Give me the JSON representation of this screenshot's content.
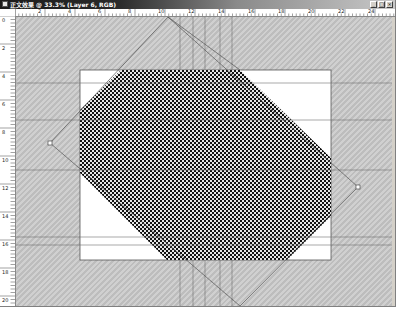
{
  "window": {
    "title": "正文效果 @ 33.3% (Layer 6, RGB)",
    "buttons": {
      "minimize": "_",
      "maximize": "□",
      "close": "×"
    }
  },
  "ruler_top": {
    "labels": [
      "2",
      "4",
      "6",
      "8",
      "10",
      "12",
      "14",
      "16",
      "18",
      "20",
      "22",
      "24"
    ]
  },
  "ruler_left": {
    "labels": [
      "0",
      "2",
      "4",
      "6",
      "8",
      "10",
      "12",
      "14",
      "16",
      "18",
      "20"
    ]
  },
  "canvas": {
    "zoom": "33.3%",
    "layer": "Layer 6",
    "mode": "RGB",
    "colors": {
      "background_hatch": "#c4c4c4",
      "document": "#ffffff",
      "pattern": "#1a1a1a",
      "guide": "#6e6e6e"
    }
  }
}
